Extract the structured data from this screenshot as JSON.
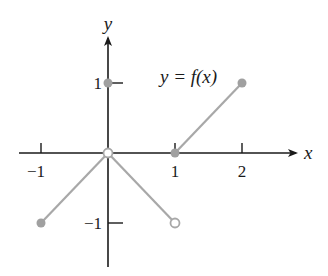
{
  "chart_data": {
    "type": "line",
    "title": "",
    "function_label": "y = f(x)",
    "xlabel": "x",
    "ylabel": "y",
    "xlim": [
      -1.3,
      2.6
    ],
    "ylim": [
      -1.6,
      1.75
    ],
    "grid": false,
    "x_ticks": [
      {
        "value": -1,
        "label": "−1"
      },
      {
        "value": 1,
        "label": "1"
      },
      {
        "value": 2,
        "label": "2"
      }
    ],
    "y_ticks": [
      {
        "value": 1,
        "label": "1"
      },
      {
        "value": -1,
        "label": "−1"
      }
    ],
    "segments": [
      {
        "from": [
          -1,
          -1
        ],
        "to": [
          0,
          0
        ]
      },
      {
        "from": [
          0,
          0
        ],
        "to": [
          1,
          -1
        ]
      },
      {
        "from": [
          1,
          0
        ],
        "to": [
          2,
          1
        ]
      }
    ],
    "points": [
      {
        "x": -1,
        "y": -1,
        "filled": true
      },
      {
        "x": 0,
        "y": 0,
        "filled": false
      },
      {
        "x": 1,
        "y": -1,
        "filled": false
      },
      {
        "x": 0,
        "y": 1,
        "filled": true
      },
      {
        "x": 1,
        "y": 0,
        "filled": true
      },
      {
        "x": 2,
        "y": 1,
        "filled": true
      }
    ],
    "colors": {
      "axis": "#1a1a1a",
      "curve": "#a8a8a8",
      "point_fill": "#a0a0a0"
    }
  }
}
